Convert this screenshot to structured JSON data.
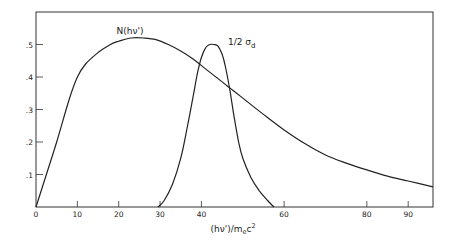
{
  "chart_data": {
    "type": "line",
    "title": "",
    "xlabel": "(hν')/m_e c²",
    "ylabel": "",
    "xlim": [
      0,
      96
    ],
    "ylim": [
      0,
      0.6
    ],
    "grid": false,
    "legend": "inline labels on curves",
    "x_ticks": [
      0,
      10,
      20,
      30,
      40,
      60,
      80,
      90
    ],
    "x_tick_labels": [
      "0",
      "10",
      "20",
      "30",
      "40",
      "60",
      "80",
      "90"
    ],
    "y_ticks": [
      0.1,
      0.2,
      0.3,
      0.4,
      0.5
    ],
    "y_tick_labels": [
      ".1",
      ".2",
      ".3",
      ".4",
      ".5"
    ],
    "series": [
      {
        "name": "N(hν')",
        "label_pos": [
          28,
          0.545
        ],
        "x": [
          0,
          2,
          5,
          8,
          10,
          12,
          15,
          18,
          20,
          23,
          26,
          29,
          32,
          35,
          38,
          41,
          44,
          47,
          50,
          55,
          60,
          65,
          70,
          75,
          80,
          85,
          90,
          96
        ],
        "values": [
          0.0,
          0.08,
          0.2,
          0.33,
          0.4,
          0.44,
          0.475,
          0.5,
          0.51,
          0.52,
          0.52,
          0.515,
          0.5,
          0.48,
          0.455,
          0.425,
          0.395,
          0.365,
          0.335,
          0.285,
          0.237,
          0.195,
          0.16,
          0.135,
          0.114,
          0.095,
          0.08,
          0.062
        ]
      },
      {
        "name": "1/2 σ_d",
        "label_pos": [
          46.5,
          0.5
        ],
        "x": [
          29.5,
          31,
          33,
          35,
          36.5,
          38,
          39,
          40,
          41,
          42,
          43,
          44,
          45,
          46,
          47,
          48,
          49,
          50,
          52,
          54,
          56,
          57.5
        ],
        "values": [
          0.0,
          0.02,
          0.07,
          0.15,
          0.24,
          0.34,
          0.41,
          0.46,
          0.49,
          0.5,
          0.5,
          0.495,
          0.47,
          0.42,
          0.35,
          0.27,
          0.2,
          0.15,
          0.09,
          0.05,
          0.02,
          0.0
        ]
      }
    ]
  },
  "labels": {
    "series_n": "N(hν')",
    "series_sigma_prefix": "1/2 σ",
    "series_sigma_sub": "d",
    "xaxis_main": "(hν')/m",
    "xaxis_sub": "e",
    "xaxis_tail": "c",
    "xaxis_sup": "2"
  }
}
